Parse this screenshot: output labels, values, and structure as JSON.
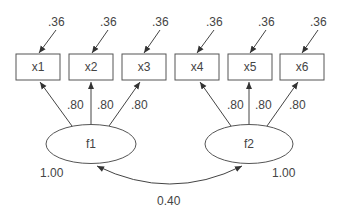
{
  "diagram": {
    "type": "confirmatory factor analysis path diagram",
    "colors": {
      "stroke": "#555555",
      "text": "#444444",
      "background": "#ffffff"
    },
    "observed": [
      {
        "id": "x1",
        "label": "x1",
        "error_variance": ".36"
      },
      {
        "id": "x2",
        "label": "x2",
        "error_variance": ".36"
      },
      {
        "id": "x3",
        "label": "x3",
        "error_variance": ".36"
      },
      {
        "id": "x4",
        "label": "x4",
        "error_variance": ".36"
      },
      {
        "id": "x5",
        "label": "x5",
        "error_variance": ".36"
      },
      {
        "id": "x6",
        "label": "x6",
        "error_variance": ".36"
      }
    ],
    "latent": [
      {
        "id": "f1",
        "label": "f1",
        "variance": "1.00"
      },
      {
        "id": "f2",
        "label": "f2",
        "variance": "1.00"
      }
    ],
    "loadings": [
      {
        "from": "f1",
        "to": "x1",
        "value": ".80"
      },
      {
        "from": "f1",
        "to": "x2",
        "value": ".80"
      },
      {
        "from": "f1",
        "to": "x3",
        "value": ".80"
      },
      {
        "from": "f2",
        "to": "x4",
        "value": ".80"
      },
      {
        "from": "f2",
        "to": "x5",
        "value": ".80"
      },
      {
        "from": "f2",
        "to": "x6",
        "value": ".80"
      }
    ],
    "covariance": {
      "between": [
        "f1",
        "f2"
      ],
      "value": "0.40"
    }
  }
}
